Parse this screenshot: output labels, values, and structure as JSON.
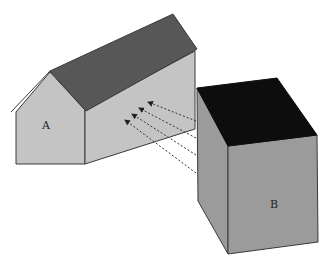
{
  "diagram": {
    "type": "illustration",
    "objects": [
      {
        "id": "A",
        "label": "A",
        "shape": "house-gable-roof"
      },
      {
        "id": "B",
        "label": "B",
        "shape": "rectangular-block"
      }
    ],
    "arrows": {
      "count": 4,
      "style": "dashed",
      "from": "B",
      "to": "A"
    },
    "colors": {
      "wall_light": "#c4c4c4",
      "roof": "#575757",
      "block_face": "#9b9b9b",
      "block_top": "#0d0d0d",
      "outline": "#3a3a3a"
    }
  }
}
